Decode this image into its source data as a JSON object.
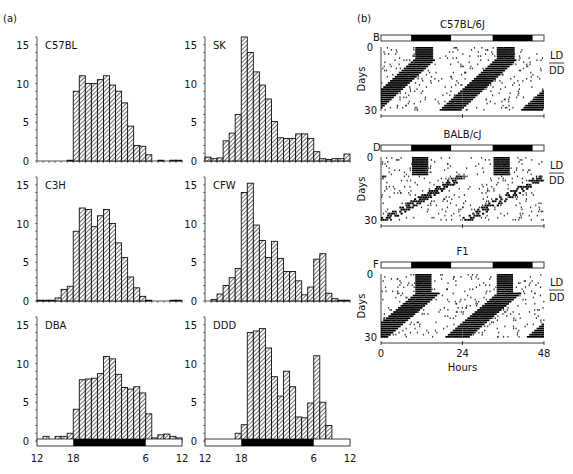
{
  "panel_a_label": "(a)",
  "panel_b_label": "(b)",
  "chart_data": [
    {
      "type": "bar",
      "title": "C57BL",
      "xlabel": "",
      "ylabel": "",
      "x_tick_labels": [
        "12",
        "18",
        "6",
        "12"
      ],
      "ylim": [
        0,
        16
      ],
      "y_ticks": [
        0,
        5,
        10,
        15
      ],
      "bins": 24,
      "values": [
        0,
        0,
        0,
        0,
        0,
        0.1,
        9,
        11,
        10,
        10,
        10.5,
        11,
        9.8,
        9,
        7.5,
        4.5,
        2,
        1.9,
        0.8,
        0,
        0.1,
        0,
        0.1,
        0.1
      ]
    },
    {
      "type": "bar",
      "title": "SK",
      "xlabel": "",
      "ylabel": "",
      "x_tick_labels": [
        "12",
        "18",
        "6",
        "12"
      ],
      "ylim": [
        0,
        16
      ],
      "y_ticks": [
        0,
        5,
        10,
        15
      ],
      "bins": 24,
      "values": [
        0.5,
        0.3,
        0.4,
        2.6,
        3.6,
        6,
        16,
        14,
        11.5,
        9.8,
        8,
        5.1,
        3,
        2.9,
        2.9,
        3.5,
        3.5,
        2.9,
        1.2,
        0.3,
        0.2,
        0.3,
        0.3,
        0.9
      ]
    },
    {
      "type": "bar",
      "title": "C3H",
      "xlabel": "",
      "ylabel": "",
      "x_tick_labels": [
        "12",
        "18",
        "6",
        "12"
      ],
      "ylim": [
        0,
        16
      ],
      "y_ticks": [
        0,
        5,
        10,
        15
      ],
      "bins": 24,
      "values": [
        0.1,
        0.1,
        0.1,
        0.4,
        1.5,
        1.9,
        9,
        12,
        11.8,
        9.6,
        11,
        11.8,
        10,
        7.5,
        5.6,
        3.1,
        1.7,
        0.6,
        0.1,
        0,
        0,
        0,
        0.1,
        0.1
      ]
    },
    {
      "type": "bar",
      "title": "CFW",
      "xlabel": "",
      "ylabel": "",
      "x_tick_labels": [
        "12",
        "18",
        "6",
        "12"
      ],
      "ylim": [
        0,
        16
      ],
      "y_ticks": [
        0,
        5,
        10,
        15
      ],
      "bins": 24,
      "values": [
        0,
        0.2,
        0.9,
        2,
        3,
        4.2,
        14,
        15.2,
        9.8,
        7.8,
        5.6,
        7.7,
        5.5,
        3.8,
        3.8,
        2.6,
        0.8,
        1.8,
        5.4,
        6.1,
        1,
        0.3,
        0.1,
        0.1
      ]
    },
    {
      "type": "bar",
      "title": "DBA",
      "xlabel": "",
      "ylabel": "",
      "x_tick_labels": [
        "12",
        "18",
        "6",
        "12"
      ],
      "ylim": [
        0,
        16
      ],
      "y_ticks": [
        0,
        5,
        10,
        15
      ],
      "bins": 24,
      "values": [
        0,
        0.6,
        0,
        0.6,
        0.6,
        1,
        4.1,
        7.9,
        8,
        8.1,
        8.7,
        10.9,
        10.6,
        8.6,
        6.9,
        6.7,
        7,
        6.2,
        3.5,
        0.4,
        0.8,
        0.9,
        0.6,
        0.4
      ]
    },
    {
      "type": "bar",
      "title": "DDD",
      "xlabel": "",
      "ylabel": "",
      "x_tick_labels": [
        "12",
        "18",
        "6",
        "12"
      ],
      "ylim": [
        0,
        16
      ],
      "y_ticks": [
        0,
        5,
        10,
        15
      ],
      "bins": 24,
      "values": [
        0,
        0,
        0,
        0,
        0.1,
        1,
        2.1,
        14,
        14.2,
        14.5,
        12,
        8.3,
        5.8,
        9,
        7,
        3.1,
        3,
        4.9,
        11,
        5,
        2,
        0.1,
        0,
        0
      ]
    }
  ],
  "light_dark_bar": {
    "light_start": "12",
    "dark_start": "18",
    "dark_end": "6",
    "light_end": "12"
  },
  "actograms": [
    {
      "letter": "B",
      "title": "C57BL/6J",
      "ylabel": "Days",
      "y_ticks": [
        "0",
        "30"
      ],
      "side_top": "LD",
      "side_bottom": "DD"
    },
    {
      "letter": "D",
      "title": "BALB/cJ",
      "ylabel": "Days",
      "y_ticks": [
        "0",
        "30"
      ],
      "side_top": "LD",
      "side_bottom": "DD"
    },
    {
      "letter": "F",
      "title": "F1",
      "ylabel": "Days",
      "y_ticks": [
        "0",
        "30"
      ],
      "side_top": "LD",
      "side_bottom": "DD"
    }
  ],
  "actogram_x": {
    "ticks": [
      "0",
      "24",
      "48"
    ],
    "label": "Hours"
  }
}
